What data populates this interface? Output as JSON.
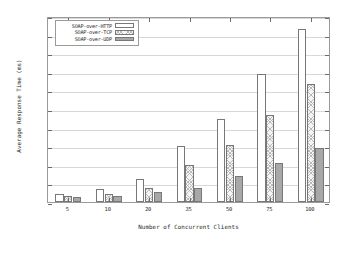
{
  "chart_data": {
    "type": "bar",
    "title": "",
    "xlabel": "Number of Concurrent Clients",
    "ylabel": "Average Response Time (ms)",
    "categories": [
      "5",
      "10",
      "20",
      "35",
      "50",
      "75",
      "100"
    ],
    "series": [
      {
        "name": "SOAP-over-HTTP",
        "values": [
          420,
          680,
          1250,
          3000,
          4450,
          6900,
          9300
        ],
        "fill": "empty"
      },
      {
        "name": "SOAP-over-TCP",
        "values": [
          330,
          410,
          760,
          1980,
          3070,
          4670,
          6350
        ],
        "fill": "cross-hatch"
      },
      {
        "name": "SOAP-over-UDP",
        "values": [
          270,
          350,
          520,
          770,
          1380,
          2120,
          2900
        ],
        "fill": "solid-grey"
      }
    ],
    "ylim": [
      0,
      10000
    ],
    "yticks": [
      0,
      1000,
      2000,
      3000,
      4000,
      5000,
      6000,
      7000,
      8000,
      9000,
      10000
    ],
    "ytick_labels": [
      "0",
      "1000",
      "2000",
      "3000",
      "4000",
      "5000",
      "6000",
      "7000",
      "8000",
      "9000",
      "10000"
    ],
    "grid": true,
    "legend_position": "top-left",
    "colors": {
      "axis": "#9a9a9a",
      "grid": "#d8d8d8",
      "text": "#2b2b2b",
      "series_empty": "#ffffff",
      "series_hatch": "#f4f4f4",
      "series_solid": "#a8a8a8",
      "bar_outline": "#787878"
    }
  }
}
